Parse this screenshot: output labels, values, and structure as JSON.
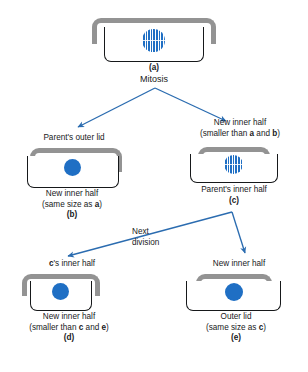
{
  "figure": {
    "accent_blue": "#2b6cb0",
    "nucleus_blue": "#1f6fc4",
    "lid_gray": "#939393",
    "inner_outline": "#16181a"
  },
  "cells": {
    "a": {
      "id_label": "(a)",
      "process_label": "Mitosis",
      "nucleus_type": "mitotic"
    },
    "b": {
      "top_label": "Parent's outer lid",
      "bottom_label_line1": "New inner half",
      "bottom_label_line2_prefix": "(same size as ",
      "bottom_label_line2_bold": "a",
      "bottom_label_line2_suffix": ")",
      "id_label": "(b)",
      "nucleus_type": "solid"
    },
    "c": {
      "top_label_line1": "New inner half",
      "top_label_line2_prefix": "(smaller than ",
      "top_label_line2_bold1": "a",
      "top_label_line2_mid": " and ",
      "top_label_line2_bold2": "b",
      "top_label_line2_suffix": ")",
      "bottom_label": "Parent's inner half",
      "id_label": "(c)",
      "nucleus_type": "mitotic"
    },
    "d": {
      "top_label_bold": "c",
      "top_label_suffix": "'s inner half",
      "bottom_label_line1": "New inner half",
      "bottom_label_line2_prefix": "(smaller than ",
      "bottom_label_line2_bold1": "c",
      "bottom_label_line2_mid": " and ",
      "bottom_label_line2_bold2": "e",
      "bottom_label_line2_suffix": ")",
      "id_label": "(d)",
      "nucleus_type": "solid"
    },
    "e": {
      "top_label": "New inner half",
      "bottom_label_line1": "Outer lid",
      "bottom_label_line2_prefix": "(same size as ",
      "bottom_label_line2_bold": "c",
      "bottom_label_line2_suffix": ")",
      "id_label": "(e)",
      "nucleus_type": "solid"
    }
  },
  "annotations": {
    "next_division_line1": "Next",
    "next_division_line2": "division"
  }
}
